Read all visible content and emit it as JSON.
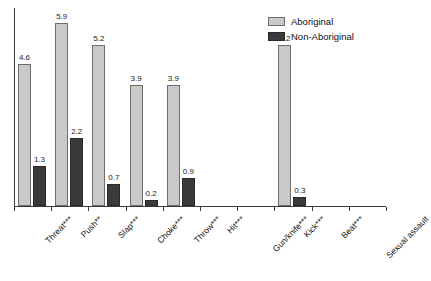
{
  "chart_data": {
    "type": "bar",
    "title": "",
    "subtitle": "",
    "xlabel": "",
    "ylabel": "",
    "ylim": [
      0,
      6.4
    ],
    "grid": false,
    "legend_position": "top-right",
    "categories": [
      "Threat***",
      "Push**",
      "Slap***",
      "Choke***",
      "Throw***",
      "Hit***",
      "Gun/knife***",
      "Kick***",
      "Beat***",
      "Sexual assault"
    ],
    "series": [
      {
        "name": "Aboriginal",
        "color": "#c9c9c9",
        "values": [
          4.6,
          5.9,
          5.2,
          3.9,
          3.9,
          0,
          0,
          5.2,
          0,
          0
        ],
        "labels": [
          "4.6",
          "5.9",
          "5.2",
          "3.9",
          "3.9",
          "",
          "",
          "5.2",
          "",
          ""
        ]
      },
      {
        "name": "Non-Aboriginal",
        "color": "#3a3a3a",
        "values": [
          1.3,
          2.2,
          0.7,
          0.2,
          0.9,
          0,
          0,
          0.3,
          0,
          0
        ],
        "labels": [
          "1.3",
          "2.2",
          "0.7",
          "0.2",
          "0.9",
          "",
          "",
          "0.3",
          "",
          ""
        ]
      }
    ]
  },
  "legend": {
    "items": [
      {
        "label": "Aboriginal",
        "swatch": "light-gray-swatch"
      },
      {
        "label": "Non-Aboriginal",
        "swatch": "dark-swatch"
      }
    ]
  }
}
